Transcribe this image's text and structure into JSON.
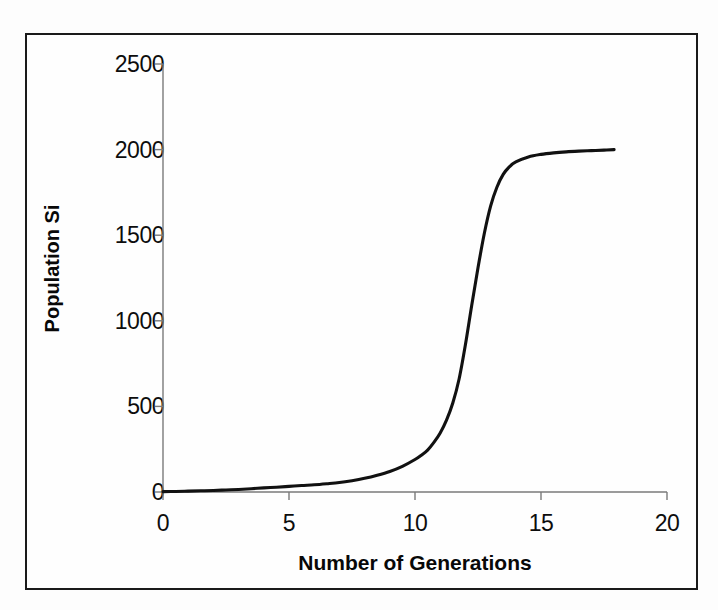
{
  "chart_data": {
    "type": "line",
    "title": "",
    "xlabel": "Number of Generations",
    "ylabel": "Population Si",
    "xlim": [
      0,
      20
    ],
    "ylim": [
      0,
      2500
    ],
    "xticks": [
      "0",
      "5",
      "10",
      "15",
      "20"
    ],
    "xtick_values": [
      0,
      5,
      10,
      15,
      20
    ],
    "yticks": [
      "0",
      "500",
      "1000",
      "1500",
      "2000",
      "2500"
    ],
    "ytick_values": [
      0,
      500,
      1000,
      1500,
      2000,
      2500
    ],
    "grid": false,
    "legend": "none",
    "line_color": "#111111",
    "background_color": "#fefefe",
    "frame_color": "#1a1a1a",
    "series": [
      {
        "name": "Population Si",
        "x": [
          0,
          0.5,
          1,
          1.5,
          2,
          2.5,
          3,
          3.5,
          4,
          4.5,
          5,
          5.5,
          6,
          6.5,
          7,
          7.5,
          8,
          8.5,
          9,
          9.5,
          10,
          10.25,
          10.5,
          10.75,
          11,
          11.25,
          11.5,
          11.75,
          12,
          12.25,
          12.5,
          12.75,
          13,
          13.25,
          13.5,
          13.75,
          14,
          14.5,
          15,
          15.5,
          16,
          16.5,
          17,
          17.5,
          17.9
        ],
        "values": [
          2,
          3,
          5,
          7,
          9,
          12,
          15,
          19,
          24,
          28,
          33,
          38,
          42,
          48,
          55,
          66,
          80,
          98,
          120,
          150,
          190,
          215,
          245,
          290,
          345,
          420,
          520,
          660,
          860,
          1090,
          1310,
          1510,
          1670,
          1780,
          1855,
          1900,
          1928,
          1957,
          1972,
          1981,
          1987,
          1991,
          1994,
          1997,
          2000
        ]
      }
    ]
  },
  "axes": {
    "y_title": "Population Si",
    "x_title": "Number of Generations"
  }
}
